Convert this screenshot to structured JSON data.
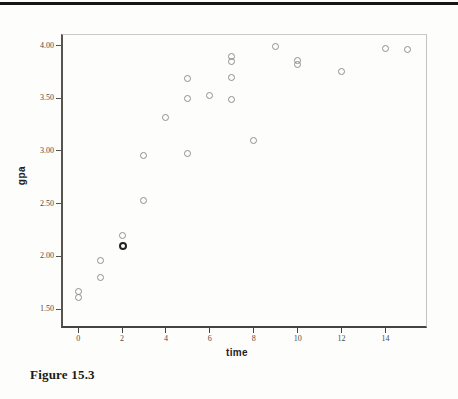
{
  "figure": {
    "caption": "Figure 15.3"
  },
  "colors": {
    "top_rule": "#161616",
    "axis_line": "#454440",
    "marker_stroke": "#8f8f8b",
    "marker_bold_stroke": "#24231f",
    "tick_label": "#4c4b47"
  },
  "chart_data": {
    "type": "scatter",
    "title": "",
    "xlabel": "time",
    "ylabel": "gpa",
    "xlim": [
      -0.78,
      15.89
    ],
    "ylim": [
      1.32,
      4.11
    ],
    "grid": false,
    "legend": "none",
    "marker": "open-circle",
    "x_ticks": [
      0,
      2,
      4,
      6,
      8,
      10,
      12,
      14
    ],
    "x_tick_labels": [
      "0",
      "2",
      "4",
      "6",
      "8",
      "10",
      "12",
      "14"
    ],
    "y_ticks": [
      4.0,
      3.5,
      3.0,
      2.5,
      2.0,
      1.5
    ],
    "y_tick_labels": [
      "4.00",
      "3.50",
      "3.00",
      "2.50",
      "2.00",
      "1.50"
    ],
    "points": [
      {
        "x": 0,
        "y": 1.67
      },
      {
        "x": 0,
        "y": 1.61
      },
      {
        "x": 1,
        "y": 1.96
      },
      {
        "x": 1,
        "y": 1.8
      },
      {
        "x": 2,
        "y": 2.2
      },
      {
        "x": 2,
        "y": 2.1,
        "bold": true
      },
      {
        "x": 3,
        "y": 2.53
      },
      {
        "x": 3,
        "y": 2.96
      },
      {
        "x": 4,
        "y": 3.32
      },
      {
        "x": 5,
        "y": 2.98
      },
      {
        "x": 5,
        "y": 3.5
      },
      {
        "x": 5,
        "y": 3.69
      },
      {
        "x": 6,
        "y": 3.53
      },
      {
        "x": 7,
        "y": 3.49
      },
      {
        "x": 7,
        "y": 3.7
      },
      {
        "x": 7,
        "y": 3.85
      },
      {
        "x": 7,
        "y": 3.9
      },
      {
        "x": 8,
        "y": 3.1
      },
      {
        "x": 9,
        "y": 3.99
      },
      {
        "x": 10,
        "y": 3.86
      },
      {
        "x": 10,
        "y": 3.82
      },
      {
        "x": 12,
        "y": 3.75
      },
      {
        "x": 14,
        "y": 3.97
      },
      {
        "x": 15,
        "y": 3.96
      }
    ]
  }
}
